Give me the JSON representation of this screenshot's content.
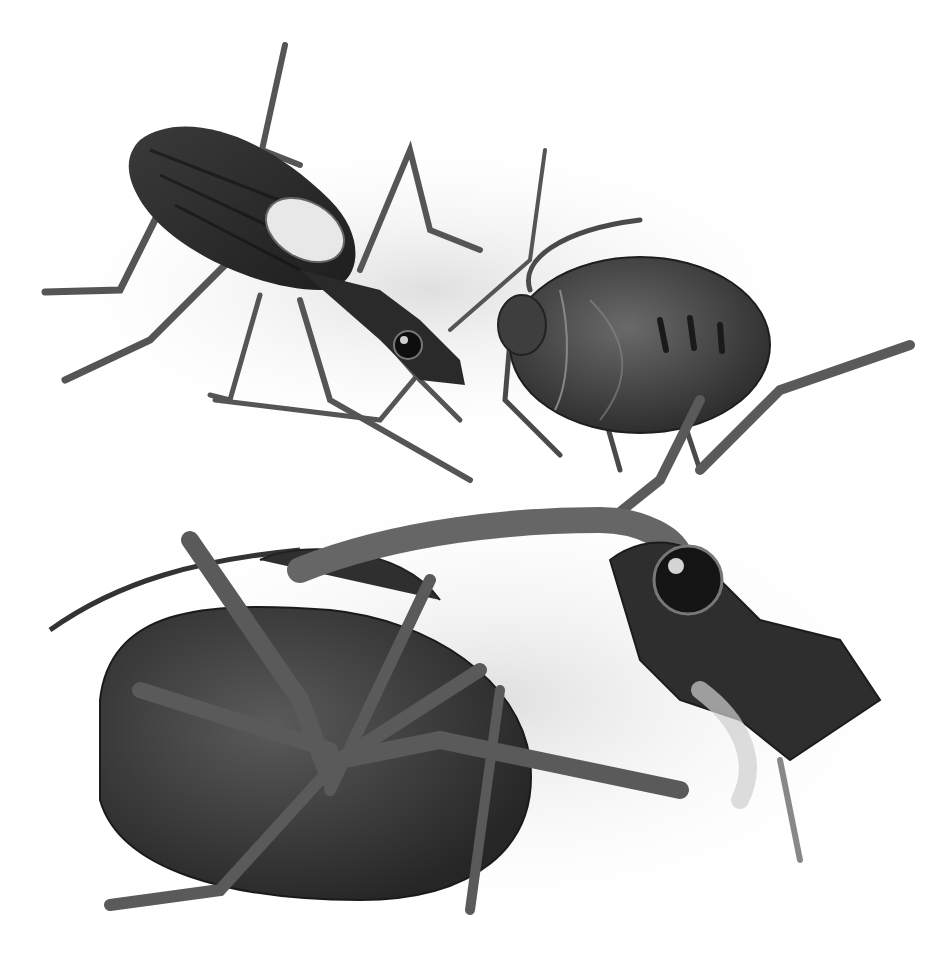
{
  "image": {
    "type": "grayscale scientific illustration",
    "subject": "insects: assassin bug nymph (top-left), shield bug nymph (top-right), assassin bug feeding on beetle (bottom)",
    "width": 952,
    "height": 960
  },
  "palette": {
    "background": "#ffffff",
    "shadow": "#e4e4e4",
    "body_dark": "#2a2a2a",
    "body_mid": "#4a4a4a",
    "body_light": "#8a8a8a",
    "leg": "#6a6a6a",
    "highlight": "#d8d8d8"
  }
}
